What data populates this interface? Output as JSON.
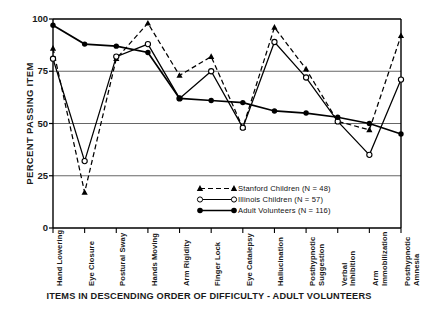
{
  "chart_data": {
    "type": "line",
    "title": "",
    "xlabel": "ITEMS IN DESCENDING ORDER OF DIFFICULTY - ADULT VOLUNTEERS",
    "ylabel": "PERCENT PASSING ITEM",
    "ylim": [
      0,
      100
    ],
    "yticks": [
      0,
      25,
      50,
      75,
      100
    ],
    "grid": true,
    "legend_position": "inside-lower-right",
    "categories": [
      "Hand Lowering",
      "Eye Closure",
      "Postural Sway",
      "Hands Moving",
      "Arm Rigidity",
      "Finger Lock",
      "Eye Catalepsy",
      "Hallucination",
      "Posthypnotic Suggestion",
      "Verbal Inhibition",
      "Arm Immobilization",
      "Posthypnotic Amnesia"
    ],
    "series": [
      {
        "name": "Stanford Children (N = 48)",
        "marker": "triangle-filled",
        "line": "dashed",
        "color": "#000000",
        "values": [
          86,
          17,
          81,
          98,
          73,
          82,
          48,
          96,
          76,
          51,
          47,
          92
        ]
      },
      {
        "name": "Illinois Children (N = 57)",
        "marker": "circle-open",
        "line": "solid",
        "color": "#000000",
        "values": [
          81,
          32,
          82,
          88,
          62,
          75,
          48,
          89,
          72,
          51,
          35,
          71
        ]
      },
      {
        "name": "Adult  Volunteers (N = 116)",
        "marker": "circle-filled",
        "line": "solid",
        "color": "#000000",
        "values": [
          97,
          88,
          87,
          84,
          62,
          61,
          60,
          56,
          55,
          53,
          50,
          45
        ]
      }
    ]
  },
  "axis": {
    "y_ticks": [
      "100",
      "75",
      "50",
      "25",
      "0"
    ],
    "y_label": "PERCENT PASSING ITEM",
    "x_label": "ITEMS IN DESCENDING ORDER OF DIFFICULTY - ADULT VOLUNTEERS"
  },
  "legend": {
    "items": [
      {
        "label": "Stanford Children (N = 48)"
      },
      {
        "label": "Illinois Children (N = 57)"
      },
      {
        "label": "Adult  Volunteers (N = 116)"
      }
    ]
  }
}
